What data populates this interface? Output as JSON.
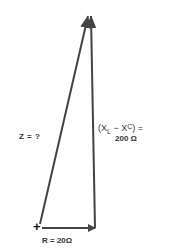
{
  "diagram": {
    "type": "impedance-vector-diagram",
    "colors": {
      "line": "#444444",
      "text": "#333333",
      "background": "#ffffff"
    },
    "origin_marker": "+",
    "vectors": [
      {
        "id": "resistance",
        "label": "R = 20Ω",
        "direction": "horizontal-right"
      },
      {
        "id": "reactance",
        "label": "(XL − XC) =",
        "value": "200 Ω",
        "direction": "vertical-up"
      },
      {
        "id": "impedance",
        "label": "Z = ?",
        "direction": "diagonal-up"
      }
    ],
    "labels": {
      "z": "Z = ?",
      "x_open": "(X",
      "x_sub_l": "L",
      "x_minus": " − X",
      "x_sub_c": "C",
      "x_close": ") =",
      "x_value": "200 Ω",
      "r": "R = 20Ω",
      "plus": "+"
    }
  }
}
